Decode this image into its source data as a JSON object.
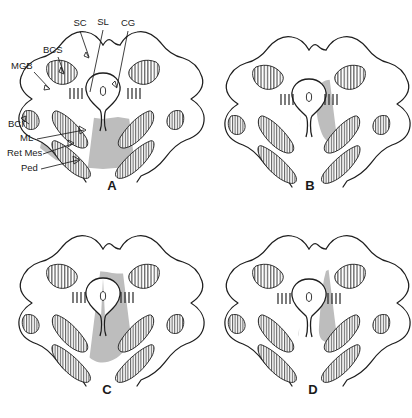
{
  "figure": {
    "panels": [
      {
        "id": "A",
        "letter": "A",
        "letter_x": 112,
        "letter_y": 190,
        "shading_description": "broad transverse band across lower midbrain tegmentum",
        "labels": [
          {
            "text": "SC",
            "x": 80,
            "y": 26,
            "anchor": "middle"
          },
          {
            "text": "SL",
            "x": 103,
            "y": 25,
            "anchor": "middle"
          },
          {
            "text": "CG",
            "x": 128,
            "y": 26,
            "anchor": "middle"
          },
          {
            "text": "BCS",
            "x": 43,
            "y": 53,
            "anchor": "start"
          },
          {
            "text": "MGB",
            "x": 11,
            "y": 69,
            "anchor": "start"
          },
          {
            "text": "BCI",
            "x": 8,
            "y": 127,
            "anchor": "start"
          },
          {
            "text": "ML",
            "x": 20,
            "y": 141,
            "anchor": "start"
          },
          {
            "text": "Ret Mes",
            "x": 7,
            "y": 156,
            "anchor": "start"
          },
          {
            "text": "Ped",
            "x": 21,
            "y": 171,
            "anchor": "start"
          }
        ],
        "tick_groups": [
          {
            "x": 70,
            "y": 93,
            "count": 4,
            "spacing": 4,
            "length": 11
          },
          {
            "x": 131,
            "y": 93,
            "count": 4,
            "spacing": 4,
            "length": 11
          }
        ]
      },
      {
        "id": "B",
        "letter": "B",
        "letter_x": 104,
        "letter_y": 190,
        "shading_description": "paired vertical paramedian gray columns flanking the aqueduct",
        "labels": [],
        "tick_groups": [
          {
            "x": 75,
            "y": 99,
            "count": 4,
            "spacing": 4,
            "length": 11
          },
          {
            "x": 124,
            "y": 99,
            "count": 4,
            "spacing": 4,
            "length": 11
          }
        ]
      },
      {
        "id": "C",
        "letter": "C",
        "letter_x": 107,
        "letter_y": 185,
        "shading_description": "large asymmetric gray region extending to the right tegmentum and base",
        "labels": [],
        "tick_groups": [
          {
            "x": 73,
            "y": 93,
            "count": 4,
            "spacing": 4,
            "length": 11
          },
          {
            "x": 126,
            "y": 93,
            "count": 4,
            "spacing": 4,
            "length": 11
          }
        ]
      },
      {
        "id": "D",
        "letter": "D",
        "letter_x": 107,
        "letter_y": 185,
        "shading_description": "bilateral wing-shaped gray regions over the dorsolateral tegmentum",
        "labels": [],
        "tick_groups": [
          {
            "x": 72,
            "y": 94,
            "count": 4,
            "spacing": 4,
            "length": 11
          },
          {
            "x": 126,
            "y": 94,
            "count": 4,
            "spacing": 4,
            "length": 11
          }
        ]
      }
    ],
    "abbreviations": {
      "SC": "superior colliculus",
      "SL": "stratum lemnisci",
      "CG": "central gray",
      "BCS": "brachium of superior colliculus",
      "MGB": "medial geniculate body",
      "BCI": "brachium of inferior colliculus",
      "ML": "medial lemniscus",
      "Ret Mes": "mesencephalic reticular formation",
      "Ped": "cerebral peduncle"
    },
    "colors": {
      "shade_gray": "#bdbdbd",
      "outline": "#1d1d1d",
      "background": "#ffffff",
      "text": "#1a1a1a"
    }
  }
}
